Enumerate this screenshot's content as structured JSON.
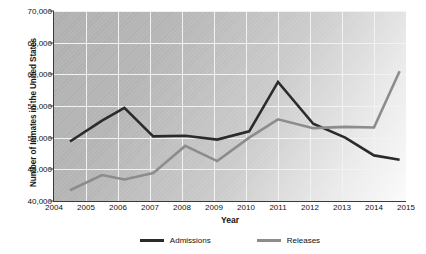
{
  "chart_data": {
    "type": "line",
    "title": "",
    "xlabel": "Year",
    "ylabel": "Number of Inmates in the United States",
    "xlim": [
      2004,
      2015
    ],
    "ylim": [
      40000,
      70000
    ],
    "ytick_labels": [
      "40,000",
      "45,000",
      "50,000",
      "55,000",
      "60,000",
      "65,000",
      "70,000"
    ],
    "ytick_values": [
      40000,
      45000,
      50000,
      55000,
      60000,
      65000,
      70000
    ],
    "xtick_labels": [
      "2004",
      "2005",
      "2006",
      "2007",
      "2008",
      "2009",
      "2010",
      "2011",
      "2012",
      "2013",
      "2014",
      "2015"
    ],
    "xtick_values": [
      2004,
      2005,
      2006,
      2007,
      2008,
      2009,
      2010,
      2011,
      2012,
      2013,
      2014,
      2015
    ],
    "grid": true,
    "legend_position": "bottom",
    "x": [
      2004.5,
      2005.5,
      2006.2,
      2007.1,
      2008.1,
      2009.1,
      2010.1,
      2011.0,
      2012.1,
      2013.1,
      2014.0,
      2014.8
    ],
    "series": [
      {
        "name": "Admissions",
        "color": "#2b2b2b",
        "values": [
          49400,
          52700,
          54700,
          50200,
          50300,
          49700,
          51000,
          58800,
          52200,
          50000,
          47200,
          46500
        ]
      },
      {
        "name": "Releases",
        "color": "#8c8c8c",
        "values": [
          41700,
          44100,
          43400,
          44400,
          48700,
          46300,
          50000,
          52900,
          51500,
          51700,
          51600,
          60500
        ]
      }
    ]
  },
  "legend": {
    "items": [
      {
        "label": "Admissions",
        "color": "#2b2b2b"
      },
      {
        "label": "Releases",
        "color": "#8c8c8c"
      }
    ]
  },
  "colors": {
    "plot_background": "#b3b3b3",
    "gridline": "#f2f2f2",
    "axis": "#3a3a3a",
    "admissions": "#2b2b2b",
    "releases": "#8c8c8c"
  }
}
